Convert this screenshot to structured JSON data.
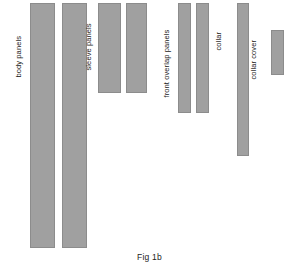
{
  "figure": {
    "caption": "Fig 1b",
    "background_color": "#ffffff",
    "panel_fill_color": "#a0a0a0",
    "panel_stroke_color": "#8c8c8c",
    "label_color": "#1a1a1a"
  },
  "groups": [
    {
      "id": "body-panels",
      "label": "body panels",
      "label_x": 22,
      "label_y": 70,
      "pieces": [
        {
          "x": 30,
          "y": 3,
          "w": 25,
          "h": 245
        },
        {
          "x": 62,
          "y": 3,
          "w": 25,
          "h": 245
        }
      ]
    },
    {
      "id": "sleeve-panels",
      "label": "sleeve panels",
      "label_x": 92,
      "label_y": 63,
      "pieces": [
        {
          "x": 98,
          "y": 3,
          "w": 23,
          "h": 90
        },
        {
          "x": 126,
          "y": 3,
          "w": 21,
          "h": 90
        }
      ]
    },
    {
      "id": "front-overlap-panels",
      "label": "front overlap panels",
      "label_x": 170,
      "label_y": 90,
      "pieces": [
        {
          "x": 178,
          "y": 3,
          "w": 13,
          "h": 110
        },
        {
          "x": 196,
          "y": 3,
          "w": 13,
          "h": 110
        }
      ]
    },
    {
      "id": "collar",
      "label": "collar",
      "label_x": 222,
      "label_y": 43,
      "pieces": [
        {
          "x": 237,
          "y": 3,
          "w": 12,
          "h": 153
        }
      ]
    },
    {
      "id": "collar-cover",
      "label": "collar cover",
      "label_x": 257,
      "label_y": 72,
      "pieces": [
        {
          "x": 271,
          "y": 30,
          "w": 13,
          "h": 45
        }
      ]
    }
  ]
}
